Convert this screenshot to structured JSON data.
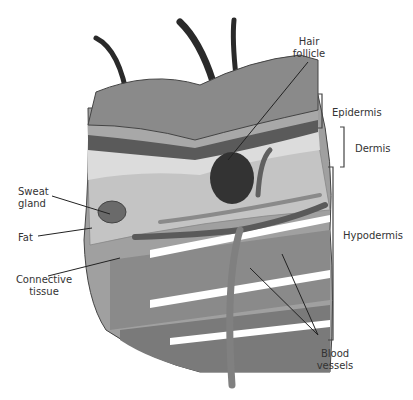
{
  "diagram": {
    "labels": {
      "hair_follicle": [
        "Hair",
        "follicle"
      ],
      "epidermis": "Epidermis",
      "dermis": "Dermis",
      "hypodermis": "Hypodermis",
      "sweat_gland": [
        "Sweat",
        "gland"
      ],
      "fat": "Fat",
      "connective_tissue": [
        "Connective",
        "tissue"
      ],
      "blood_vessels": [
        "Blood",
        "vessels"
      ]
    },
    "colors": {
      "epidermis_top": "#8a8a8a",
      "epidermis_band": "#a8a8a8",
      "dermis_dark": "#5a5a5a",
      "dermis_light": "#d8d8d8",
      "fat": "#b4b4b4",
      "connective": "#9a9a9a",
      "vessel": "#707070",
      "hair": "#2a2a2a",
      "line": "#333333"
    }
  }
}
